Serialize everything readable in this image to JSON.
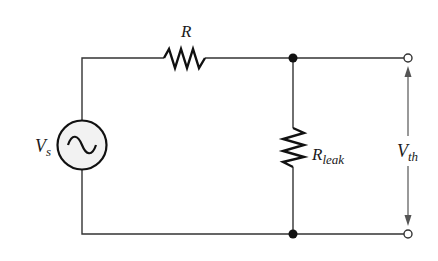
{
  "diagram": {
    "type": "circuit",
    "labels": {
      "source": "V",
      "source_sub": "s",
      "series_resistor": "R",
      "leak_resistor": "R",
      "leak_resistor_sub": "leak",
      "output_voltage": "V",
      "output_voltage_sub": "th"
    },
    "components": [
      {
        "id": "Vs",
        "kind": "ac-voltage-source"
      },
      {
        "id": "R",
        "kind": "resistor",
        "orientation": "horizontal"
      },
      {
        "id": "Rleak",
        "kind": "resistor",
        "orientation": "vertical"
      }
    ],
    "nodes": [
      "top-junction",
      "bottom-junction",
      "output-terminal-top",
      "output-terminal-bottom"
    ],
    "colors": {
      "wire": "#333333",
      "fill": "#f2f2f2",
      "ink": "#111111"
    }
  }
}
